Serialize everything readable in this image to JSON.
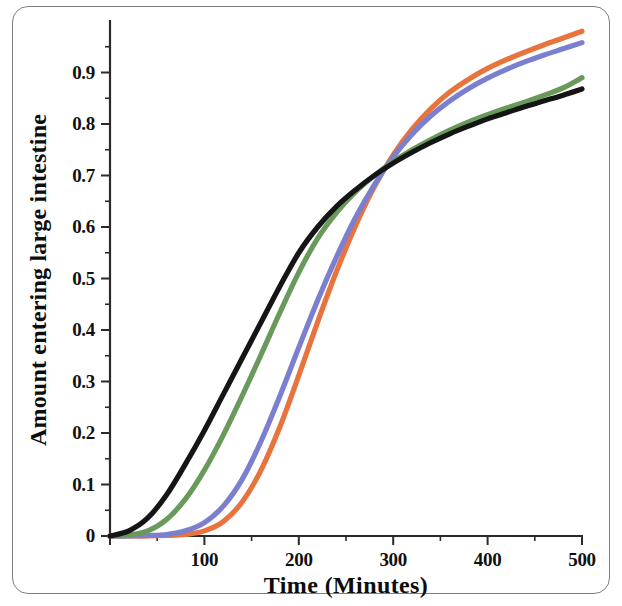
{
  "figure": {
    "frame_color": "#7d7d7d",
    "background": "#ffffff"
  },
  "chart_data": {
    "type": "line",
    "title": "",
    "subtitle": "",
    "xlabel": "Time   (Minutes)",
    "ylabel": "Amount entering large intestine",
    "xlim": [
      0,
      500
    ],
    "ylim": [
      0,
      1.0
    ],
    "grid": false,
    "legend": null,
    "legend_position": "none",
    "x_ticks": [
      0,
      100,
      200,
      300,
      400,
      500
    ],
    "x_tick_labels": [
      "",
      "100",
      "200",
      "300",
      "400",
      "500"
    ],
    "x_minor_ticks": [
      50,
      150,
      250,
      350,
      450
    ],
    "y_ticks": [
      0,
      0.1,
      0.2,
      0.3,
      0.4,
      0.5,
      0.6,
      0.7,
      0.8,
      0.9
    ],
    "y_tick_labels": [
      "0",
      "0.1",
      "0.2",
      "0.3",
      "0.4",
      "0.5",
      "0.6",
      "0.7",
      "0.8",
      "0.9"
    ],
    "y_minor_ticks": [
      0.05,
      0.15,
      0.25,
      0.35,
      0.45,
      0.55,
      0.65,
      0.75,
      0.85,
      0.95
    ],
    "x": [
      0,
      20,
      40,
      60,
      80,
      100,
      120,
      140,
      160,
      180,
      200,
      220,
      240,
      260,
      280,
      300,
      320,
      340,
      360,
      380,
      400,
      420,
      440,
      460,
      480,
      500
    ],
    "series": [
      {
        "name": "curve-black",
        "color": "#151515",
        "values": [
          0.0,
          0.01,
          0.035,
          0.08,
          0.14,
          0.205,
          0.275,
          0.345,
          0.415,
          0.485,
          0.55,
          0.6,
          0.64,
          0.672,
          0.7,
          0.724,
          0.745,
          0.764,
          0.781,
          0.796,
          0.81,
          0.822,
          0.834,
          0.845,
          0.856,
          0.868
        ]
      },
      {
        "name": "curve-green",
        "color": "#6a9a5b",
        "values": [
          0.0,
          0.002,
          0.01,
          0.032,
          0.072,
          0.128,
          0.196,
          0.272,
          0.352,
          0.434,
          0.512,
          0.578,
          0.628,
          0.668,
          0.7,
          0.727,
          0.75,
          0.77,
          0.788,
          0.804,
          0.818,
          0.831,
          0.843,
          0.856,
          0.87,
          0.89
        ]
      },
      {
        "name": "curve-blue",
        "color": "#7b7fd0",
        "values": [
          0.0,
          0.0,
          0.001,
          0.003,
          0.01,
          0.026,
          0.058,
          0.11,
          0.184,
          0.272,
          0.366,
          0.458,
          0.542,
          0.618,
          0.682,
          0.736,
          0.78,
          0.816,
          0.845,
          0.869,
          0.889,
          0.906,
          0.921,
          0.934,
          0.946,
          0.958
        ]
      },
      {
        "name": "curve-orange",
        "color": "#e8733c",
        "values": [
          0.0,
          0.0,
          0.0,
          0.001,
          0.003,
          0.01,
          0.028,
          0.066,
          0.128,
          0.212,
          0.312,
          0.416,
          0.514,
          0.602,
          0.678,
          0.74,
          0.79,
          0.83,
          0.862,
          0.887,
          0.908,
          0.925,
          0.94,
          0.954,
          0.967,
          0.98
        ]
      }
    ]
  }
}
